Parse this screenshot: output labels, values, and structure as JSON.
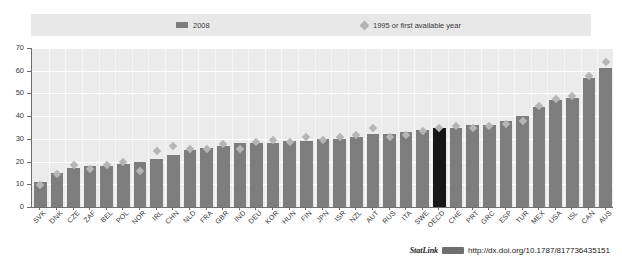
{
  "legend": {
    "series_2008_label": "2008",
    "series_1995_label": "1995 or first available year",
    "bar_color": "#7d7d7d",
    "diamond_color": "#b5b5b5",
    "highlight_color": "#161616"
  },
  "footer": {
    "statlink_label": "StatLink",
    "url": "http://dx.doi.org/10.1787/817736435151"
  },
  "chart_data": {
    "type": "bar",
    "title": "",
    "subtitle": "",
    "xlabel": "",
    "ylabel": "",
    "ylim": [
      0,
      70
    ],
    "yticks": [
      0,
      10,
      20,
      30,
      40,
      50,
      60,
      70
    ],
    "ytick_labels": [
      "0",
      "10",
      "20",
      "30",
      "40",
      "50",
      "60",
      "70"
    ],
    "grid": true,
    "legend_position": "top",
    "highlight_category": "OECD",
    "categories": [
      "SVK",
      "DNK",
      "CZE",
      "ZAF",
      "BEL",
      "POL",
      "NOR",
      "IRL",
      "CHN",
      "NLD",
      "FRA",
      "GBR",
      "IND",
      "DEU",
      "KOR",
      "HUN",
      "FIN",
      "JPN",
      "ISR",
      "NZL",
      "AUT",
      "RUS",
      "ITA",
      "SWE",
      "OECD",
      "CHE",
      "PRT",
      "GRC",
      "ESP",
      "TUR",
      "MEX",
      "USA",
      "ISL",
      "CAN",
      "AUS"
    ],
    "series": [
      {
        "name": "2008",
        "type": "bar",
        "values": [
          11,
          15,
          17,
          18,
          18,
          19,
          20,
          21,
          23,
          25,
          26,
          27,
          28,
          28,
          28,
          29,
          29,
          30,
          30,
          31,
          32,
          32,
          33,
          34,
          35,
          35,
          36,
          36,
          38,
          40,
          44,
          47,
          48,
          57,
          61
        ]
      },
      {
        "name": "1995 or first available year",
        "type": "scatter",
        "values": [
          11,
          16,
          20,
          18,
          20,
          21,
          17,
          26,
          28,
          27,
          27,
          29,
          27,
          30,
          31,
          30,
          32,
          31,
          32,
          33,
          36,
          32,
          33,
          35,
          36,
          37,
          36,
          37,
          38,
          39,
          46,
          49,
          50,
          59,
          65
        ]
      }
    ]
  }
}
